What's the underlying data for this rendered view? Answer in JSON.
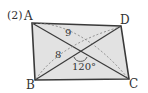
{
  "problem_label": "(2)",
  "vertices": {
    "A": "A",
    "B": "B",
    "C": "C",
    "D": "D"
  },
  "measures": {
    "seg_9": "9",
    "seg_8": "8",
    "angle": "120°"
  },
  "colors": {
    "fill": "#e2e2e2",
    "stroke": "#3a3a3a",
    "dashed": "#777777"
  }
}
